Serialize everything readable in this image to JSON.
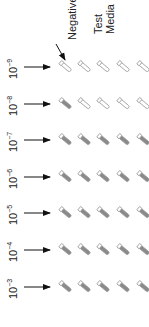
{
  "labels": {
    "negative": "Negative",
    "test_media_line1": "Test",
    "test_media_line2": "Media"
  },
  "rows": [
    {
      "base": "10",
      "exp": "−9",
      "tubes": [
        "empty",
        "empty",
        "empty",
        "empty",
        "empty"
      ]
    },
    {
      "base": "10",
      "exp": "−8",
      "tubes": [
        "filled",
        "empty",
        "empty",
        "empty",
        "empty"
      ]
    },
    {
      "base": "10",
      "exp": "−7",
      "tubes": [
        "filled",
        "filled",
        "filled",
        "filled",
        "filled"
      ]
    },
    {
      "base": "10",
      "exp": "−6",
      "tubes": [
        "filled",
        "filled",
        "filled",
        "filled",
        "filled"
      ]
    },
    {
      "base": "10",
      "exp": "−5",
      "tubes": [
        "filled",
        "filled",
        "filled",
        "filled",
        "filled"
      ]
    },
    {
      "base": "10",
      "exp": "−4",
      "tubes": [
        "filled",
        "filled",
        "filled",
        "filled",
        "filled"
      ]
    },
    {
      "base": "10",
      "exp": "−3",
      "tubes": [
        "filled",
        "filled",
        "filled",
        "filled",
        "filled"
      ]
    }
  ],
  "colors": {
    "filled": "#8a8a8a",
    "outline": "#9a9a9a",
    "arrow": "#111111",
    "text": "#222222"
  }
}
